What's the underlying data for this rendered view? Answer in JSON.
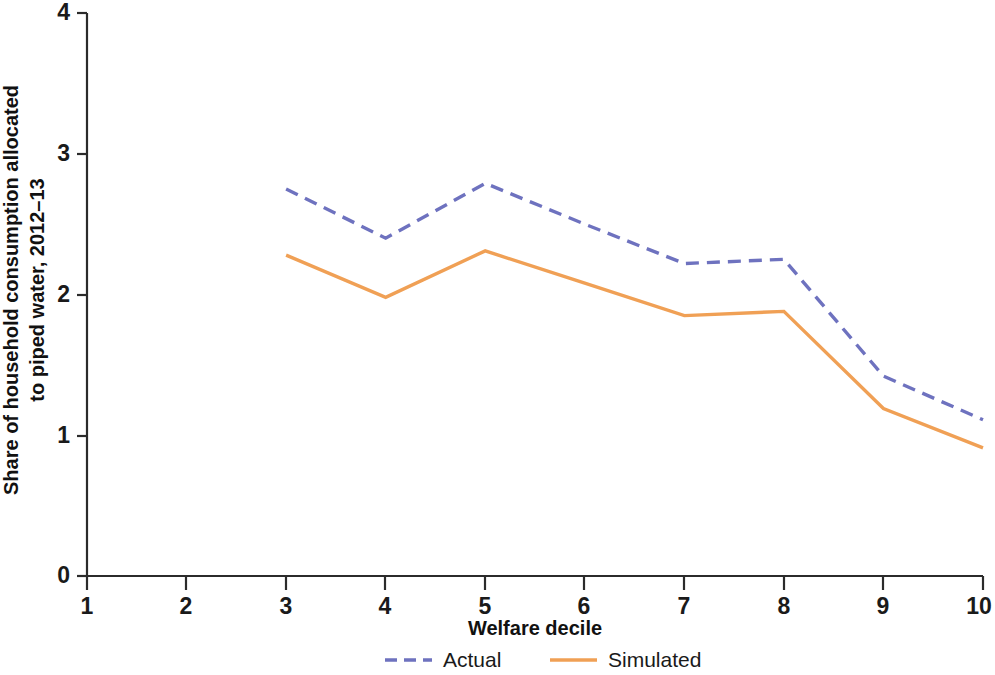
{
  "chart_data": {
    "type": "line",
    "title": "",
    "xlabel": "Welfare decile",
    "ylabel": "Share of household consumption allocated to piped water, 2012–13",
    "x": [
      1,
      2,
      3,
      4,
      5,
      6,
      7,
      8,
      9,
      10
    ],
    "xtick_labels": [
      "1",
      "2",
      "3",
      "4",
      "5",
      "6",
      "7",
      "8",
      "9",
      "10"
    ],
    "ytick_labels": [
      "0",
      "1",
      "2",
      "3",
      "4"
    ],
    "ytick_values": [
      0,
      1,
      2,
      3,
      4
    ],
    "xlim": [
      1,
      10
    ],
    "ylim": [
      0,
      4
    ],
    "grid": false,
    "legend_position": "bottom-center",
    "series": [
      {
        "name": "Actual",
        "style": "dashed",
        "color": "#6e72bf",
        "x": [
          3,
          4,
          5,
          6,
          7,
          8,
          9,
          10
        ],
        "values": [
          2.75,
          2.4,
          2.79,
          2.5,
          2.22,
          2.25,
          1.42,
          1.11
        ]
      },
      {
        "name": "Simulated",
        "style": "solid",
        "color": "#f0a055",
        "x": [
          3,
          4,
          5,
          6,
          7,
          8,
          9,
          10
        ],
        "values": [
          2.28,
          1.98,
          2.31,
          2.08,
          1.85,
          1.88,
          1.19,
          0.91
        ]
      }
    ]
  },
  "legend": {
    "items": [
      {
        "label": "Actual",
        "color": "#6e72bf",
        "style": "dashed"
      },
      {
        "label": "Simulated",
        "color": "#f0a055",
        "style": "solid"
      }
    ]
  },
  "axes": {
    "x_title": "Welfare decile",
    "y_title_line1": "Share of household consumption allocated",
    "y_title_line2": "to piped water, 2012–13"
  }
}
